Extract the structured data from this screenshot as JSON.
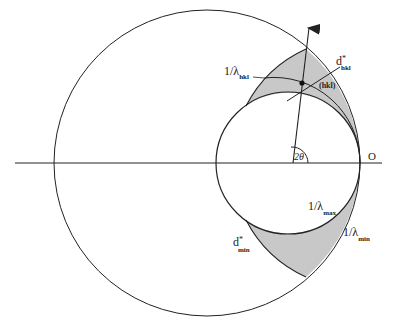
{
  "diagram": {
    "type": "ewald-construction",
    "colors": {
      "stroke": "#222222",
      "shade": "#c8c8c8",
      "background": "#ffffff"
    },
    "labels": {
      "lambda_hkl": {
        "main": "1/λ",
        "sub": "hkl"
      },
      "d_hkl": {
        "main": "d",
        "sup": "*",
        "sub": "hkl"
      },
      "hkl_point": "(hkl)",
      "angle": "2θ",
      "origin": "O",
      "lambda_max": {
        "main": "1/λ",
        "sub": "max"
      },
      "lambda_min": {
        "main": "1/λ",
        "sub": "min"
      },
      "d_min": {
        "main": "d",
        "sup": "*",
        "sub": "min"
      }
    }
  }
}
